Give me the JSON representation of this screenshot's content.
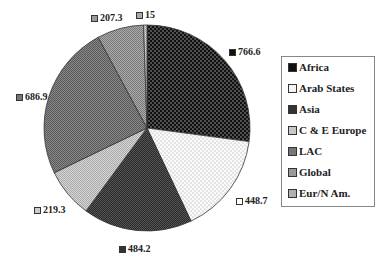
{
  "chart_data": {
    "type": "pie",
    "title": "",
    "start_angle": "12 o'clock",
    "direction": "clockwise",
    "categories": [
      "Africa",
      "Arab States",
      "Asia",
      "C & E Europe",
      "LAC",
      "Global",
      "Eur/N Am."
    ],
    "values": [
      766.6,
      448.7,
      484.2,
      219.3,
      686.9,
      207.3,
      15
    ],
    "data_labels": [
      "766.6",
      "448.7",
      "484.2",
      "219.3",
      "686.9",
      "207.3",
      "15"
    ],
    "colors": [
      "#1a1a1a",
      "#f0f0f0",
      "#3a3a3a",
      "#c8c8c8",
      "#7a7a7a",
      "#a0a0a0",
      "#b4b4b4"
    ],
    "patterns": [
      "dots-dark",
      "dots-light",
      "checker-dark",
      "checker-light",
      "checker-mid",
      "checker-mid-light",
      "checker-light"
    ],
    "legend_position": "right"
  },
  "legend": {
    "items": [
      {
        "label": "Africa"
      },
      {
        "label": "Arab States"
      },
      {
        "label": "Asia"
      },
      {
        "label": "C & E Europe"
      },
      {
        "label": "LAC"
      },
      {
        "label": "Global"
      },
      {
        "label": "Eur/N Am."
      }
    ]
  },
  "labels": {
    "africa": "766.6",
    "arab": "448.7",
    "asia": "484.2",
    "cee": "219.3",
    "lac": "686.9",
    "global": "207.3",
    "eur": "15"
  }
}
